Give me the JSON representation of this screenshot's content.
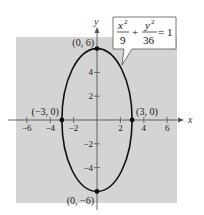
{
  "chart_data": {
    "type": "line",
    "title": "",
    "xlabel": "x",
    "ylabel": "y",
    "xlim": [
      -7,
      7
    ],
    "ylim": [
      -6.8,
      7
    ],
    "grid": false,
    "background_color": "#d4d4d4",
    "curve_color": "#111111",
    "equation": {
      "x_num": "x",
      "x_exp": "2",
      "x_den": "9",
      "plus": "+",
      "y_num": "y",
      "y_exp": "2",
      "y_den": "36",
      "rhs": "= 1"
    },
    "series": [
      {
        "name": "ellipse",
        "shape": "ellipse",
        "center": [
          0,
          0
        ],
        "a": 3,
        "b": 6
      }
    ],
    "x_ticks": [
      {
        "value": -6,
        "label": "−6"
      },
      {
        "value": -4,
        "label": "−4"
      },
      {
        "value": -2,
        "label": "−2"
      },
      {
        "value": 2,
        "label": "2"
      },
      {
        "value": 4,
        "label": "4"
      },
      {
        "value": 6,
        "label": "6"
      }
    ],
    "y_ticks": [
      {
        "value": 4,
        "label": "4"
      },
      {
        "value": 2,
        "label": "2"
      },
      {
        "value": -2,
        "label": "−2"
      },
      {
        "value": -4,
        "label": "−4"
      }
    ],
    "points": [
      {
        "x": 0,
        "y": 6,
        "label": "(0, 6)",
        "anchor": "left-above"
      },
      {
        "x": 0,
        "y": -6,
        "label": "(0, −6)",
        "anchor": "left-below"
      },
      {
        "x": -3,
        "y": 0,
        "label": "(−3, 0)",
        "anchor": "left-above"
      },
      {
        "x": 3,
        "y": 0,
        "label": "(3, 0)",
        "anchor": "right-above"
      }
    ]
  }
}
